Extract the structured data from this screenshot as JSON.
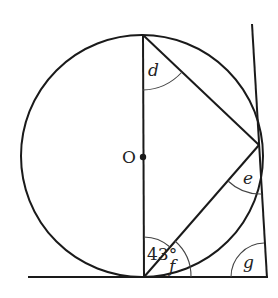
{
  "diagram": {
    "type": "circle-geometry",
    "center_label": "O",
    "angle_labels": {
      "d": "d",
      "e": "e",
      "f": "f",
      "g": "g",
      "given": "43°"
    },
    "colors": {
      "stroke": "#1a1a1a",
      "background": "#ffffff"
    }
  }
}
